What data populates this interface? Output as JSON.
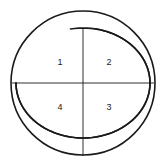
{
  "figure": {
    "background_color": "#ffffff",
    "stroke_color": "#1a1a1a",
    "label_color": "#1a1a1a",
    "outer_circle": {
      "center_x": 83,
      "center_y": 83,
      "radius": 72,
      "stroke_width": 1.6
    },
    "inner_ellipse": {
      "center_x": 83,
      "center_y": 83,
      "radius_x": 67,
      "radius_y": 55,
      "stroke_width": 1.6,
      "gap_note": "arc drawn with small gaps near the top"
    },
    "horizontal_diameter": {
      "x1": 12,
      "y1": 83,
      "x2": 154,
      "y2": 83,
      "stroke_width": 0.9
    },
    "vertical_line": {
      "x1": 83,
      "y1": 28,
      "x2": 83,
      "y2": 156,
      "stroke_width": 0.9
    },
    "labels": [
      {
        "text": "1",
        "x": 60,
        "y": 63,
        "quadrant": "top-left"
      },
      {
        "text": "2",
        "x": 109,
        "y": 63,
        "quadrant": "top-right"
      },
      {
        "text": "4",
        "x": 60,
        "y": 108,
        "quadrant": "bottom-left"
      },
      {
        "text": "3",
        "x": 109,
        "y": 108,
        "quadrant": "bottom-right"
      }
    ]
  }
}
